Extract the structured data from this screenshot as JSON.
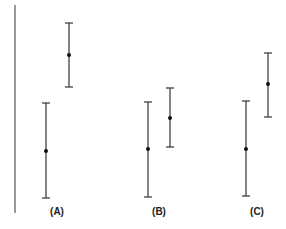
{
  "chart_data": {
    "type": "errorbar",
    "title": "",
    "xlabel": "",
    "ylabel": "",
    "grid": false,
    "categories": [
      "(A)",
      "(B)",
      "(C)"
    ],
    "series": [
      {
        "name": "group 1",
        "means": [
          151,
          149,
          149
        ],
        "lower": [
          198,
          197,
          196
        ],
        "upper": [
          103,
          102,
          101
        ]
      },
      {
        "name": "group 2",
        "means": [
          55,
          118,
          84
        ],
        "lower": [
          87,
          147,
          117
        ],
        "upper": [
          23,
          88,
          53
        ]
      }
    ],
    "note": "Values are pixel y-positions (no numeric axis shown); smaller = higher on chart"
  },
  "labels": {
    "a": "(A)",
    "b": "(B)",
    "c": "(C)"
  }
}
